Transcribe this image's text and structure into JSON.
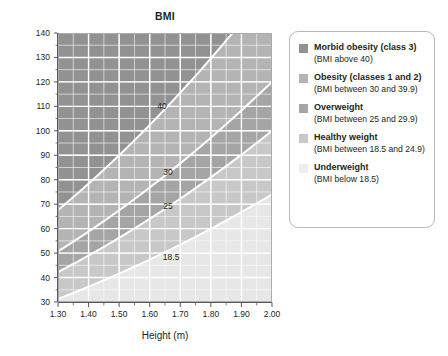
{
  "chart_data": {
    "type": "area",
    "title": "BMI",
    "xlabel": "Height (m)",
    "ylabel": "Weight (kg)",
    "xlim": [
      1.3,
      2.0
    ],
    "ylim": [
      30,
      140
    ],
    "xticks": [
      "1.30",
      "1.40",
      "1.50",
      "1.60",
      "1.70",
      "1.80",
      "1.90",
      "2.00"
    ],
    "xtick_values": [
      1.3,
      1.4,
      1.5,
      1.6,
      1.7,
      1.8,
      1.9,
      2.0
    ],
    "xminor_step": 0.05,
    "yticks": [
      "30",
      "40",
      "50",
      "60",
      "70",
      "80",
      "90",
      "100",
      "110",
      "120",
      "130",
      "140"
    ],
    "ytick_values": [
      30,
      40,
      50,
      60,
      70,
      80,
      90,
      100,
      110,
      120,
      130,
      140
    ],
    "yminor_step": 5,
    "grid": true,
    "legend_position": "right",
    "formula": "weight = bmi * height^2",
    "curves": [
      {
        "label": "40",
        "bmi": 40,
        "label_x": 1.64,
        "label_y": 109
      },
      {
        "label": "30",
        "bmi": 30,
        "label_x": 1.66,
        "label_y": 82
      },
      {
        "label": "25",
        "bmi": 25,
        "label_x": 1.66,
        "label_y": 68
      },
      {
        "label": "18.5",
        "bmi": 18.5,
        "label_x": 1.67,
        "label_y": 47
      }
    ],
    "bands": [
      {
        "name": "Morbid obesity (class 3)",
        "bmi_min": 40,
        "bmi_max": 200,
        "color": "#929292"
      },
      {
        "name": "Obesity (classes 1 and 2)",
        "bmi_min": 30,
        "bmi_max": 40,
        "color": "#b4b4b4"
      },
      {
        "name": "Overweight",
        "bmi_min": 25,
        "bmi_max": 30,
        "color": "#a5a5a5"
      },
      {
        "name": "Healthy weight",
        "bmi_min": 18.5,
        "bmi_max": 25,
        "color": "#c8c8c8"
      },
      {
        "name": "Underweight",
        "bmi_min": 0,
        "bmi_max": 18.5,
        "color": "#e7e7e7"
      }
    ],
    "gridline_color": "#ffffff",
    "curve_color": "#ffffff",
    "axis_color": "#58595b"
  },
  "legend": {
    "items": [
      {
        "title": "Morbid obesity (class 3)",
        "subtitle": "(BMI above 40)",
        "color": "#929292"
      },
      {
        "title": "Obesity (classes 1 and 2)",
        "subtitle": "(BMI between 30 and 39.9)",
        "color": "#b4b4b4"
      },
      {
        "title": "Overweight",
        "subtitle": "(BMI between 25 and 29.9)",
        "color": "#a5a5a5"
      },
      {
        "title": "Healthy weight",
        "subtitle": "(BMI between 18.5 and 24.9)",
        "color": "#c8c8c8"
      },
      {
        "title": "Underweight",
        "subtitle": "(BMI below 18.5)",
        "color": "#ededed"
      }
    ]
  }
}
